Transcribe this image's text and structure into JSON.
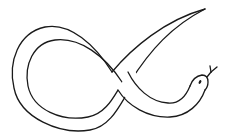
{
  "figure": {
    "alt": "Line drawing of a snake coiled into an alpha/loop shape with its head on the right and tongue extended",
    "stroke_color": "#1a1a1a",
    "background_color": "#ffffff"
  }
}
